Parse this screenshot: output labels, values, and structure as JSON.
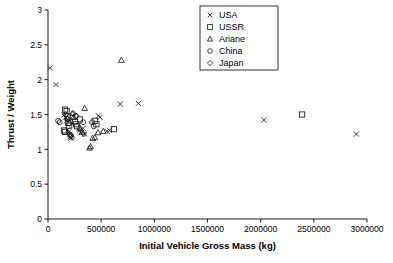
{
  "chart_data": {
    "type": "scatter",
    "title": "",
    "xlabel": "Initial Vehicle Gross Mass (kg)",
    "ylabel": "Thrust / Weight",
    "xlim": [
      0,
      3000000
    ],
    "ylim": [
      0,
      3
    ],
    "xticks": [
      0,
      500000,
      1000000,
      1500000,
      2000000,
      2500000,
      3000000
    ],
    "xtick_labels": [
      "0",
      "500000",
      "1000000",
      "1500000",
      "2000000",
      "2500000",
      "3000000"
    ],
    "yticks": [
      0,
      0.5,
      1,
      1.5,
      2,
      2.5,
      3
    ],
    "ytick_labels": [
      "0",
      "0.5",
      "1",
      "1.5",
      "2",
      "2.5",
      "3"
    ],
    "grid": false,
    "legend_position": "top-center-right",
    "series": [
      {
        "name": "USA",
        "marker": "x",
        "points": [
          [
            20000,
            2.17
          ],
          [
            75000,
            1.93
          ],
          [
            150000,
            1.49
          ],
          [
            165000,
            1.46
          ],
          [
            175000,
            1.41
          ],
          [
            185000,
            1.28
          ],
          [
            195000,
            1.25
          ],
          [
            205000,
            1.22
          ],
          [
            210000,
            1.18
          ],
          [
            215000,
            1.16
          ],
          [
            295000,
            1.27
          ],
          [
            310000,
            1.24
          ],
          [
            330000,
            1.3
          ],
          [
            345000,
            1.22
          ],
          [
            475000,
            1.48
          ],
          [
            490000,
            1.46
          ],
          [
            555000,
            1.26
          ],
          [
            580000,
            1.27
          ],
          [
            680000,
            1.65
          ],
          [
            850000,
            1.66
          ],
          [
            2030000,
            1.42
          ],
          [
            2900000,
            1.22
          ]
        ]
      },
      {
        "name": "USSR",
        "marker": "square",
        "points": [
          [
            160000,
            1.57
          ],
          [
            175000,
            1.55
          ],
          [
            185000,
            1.47
          ],
          [
            190000,
            1.38
          ],
          [
            200000,
            1.34
          ],
          [
            150000,
            1.27
          ],
          [
            160000,
            1.25
          ],
          [
            255000,
            1.4
          ],
          [
            265000,
            1.36
          ],
          [
            275000,
            1.33
          ],
          [
            300000,
            1.43
          ],
          [
            440000,
            1.41
          ],
          [
            455000,
            1.36
          ],
          [
            620000,
            1.29
          ],
          [
            2390000,
            1.5
          ]
        ]
      },
      {
        "name": "Ariane",
        "marker": "triangle",
        "points": [
          [
            230000,
            1.52
          ],
          [
            240000,
            1.46
          ],
          [
            300000,
            1.3
          ],
          [
            320000,
            1.25
          ],
          [
            345000,
            1.59
          ],
          [
            390000,
            1.02
          ],
          [
            400000,
            1.04
          ],
          [
            420000,
            1.16
          ],
          [
            440000,
            1.17
          ],
          [
            470000,
            1.24
          ],
          [
            520000,
            1.26
          ],
          [
            690000,
            2.28
          ]
        ]
      },
      {
        "name": "China",
        "marker": "circle",
        "points": [
          [
            95000,
            1.41
          ],
          [
            110000,
            1.39
          ],
          [
            180000,
            1.43
          ],
          [
            200000,
            1.37
          ],
          [
            215000,
            1.2
          ],
          [
            260000,
            1.48
          ],
          [
            330000,
            1.39
          ],
          [
            415000,
            1.39
          ],
          [
            430000,
            1.33
          ]
        ]
      },
      {
        "name": "Japan",
        "marker": "diamond",
        "points": [
          [
            165000,
            1.5
          ],
          [
            190000,
            1.44
          ],
          [
            205000,
            1.21
          ],
          [
            215000,
            1.19
          ],
          [
            225000,
            1.17
          ],
          [
            240000,
            1.51
          ],
          [
            265000,
            1.48
          ],
          [
            335000,
            1.22
          ]
        ]
      }
    ]
  },
  "legend": {
    "entries": [
      {
        "label": "USA",
        "marker": "x"
      },
      {
        "label": "USSR",
        "marker": "square"
      },
      {
        "label": "Ariane",
        "marker": "triangle"
      },
      {
        "label": "China",
        "marker": "circle"
      },
      {
        "label": "Japan",
        "marker": "diamond"
      }
    ]
  }
}
